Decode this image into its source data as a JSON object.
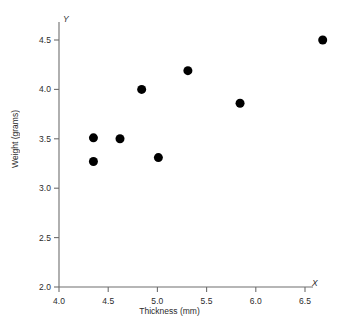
{
  "chart_data": {
    "type": "scatter",
    "title": "",
    "xlabel": "Thickness (mm)",
    "ylabel": "Weight (grams)",
    "x_axis_letter": "X",
    "y_axis_letter": "Y",
    "xlim": [
      4.0,
      6.5
    ],
    "ylim": [
      2.0,
      4.5
    ],
    "xticks": [
      "4.0",
      "4.5",
      "5.0",
      "5.5",
      "6.0",
      "6.5"
    ],
    "xtick_values": [
      4.0,
      4.5,
      5.0,
      5.5,
      6.0,
      6.5
    ],
    "yticks": [
      "2.0",
      "2.5",
      "3.0",
      "3.5",
      "4.0",
      "4.5"
    ],
    "ytick_values": [
      2.0,
      2.5,
      3.0,
      3.5,
      4.0,
      4.5
    ],
    "grid": false,
    "legend": null,
    "marker": {
      "shape": "circle",
      "color": "#000000",
      "size_px": 9
    },
    "axis_color": "#6e6e6e",
    "points": [
      {
        "x": 4.35,
        "y": 3.51
      },
      {
        "x": 4.35,
        "y": 3.27
      },
      {
        "x": 4.62,
        "y": 3.5
      },
      {
        "x": 4.84,
        "y": 4.0
      },
      {
        "x": 5.01,
        "y": 3.31
      },
      {
        "x": 5.31,
        "y": 4.19
      },
      {
        "x": 5.84,
        "y": 3.86
      },
      {
        "x": 6.68,
        "y": 4.5
      }
    ]
  }
}
